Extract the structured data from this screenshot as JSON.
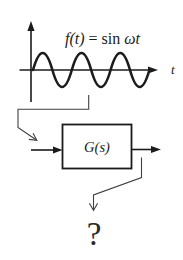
{
  "colors": {
    "ink": "#1b1b1b",
    "connector": "#404040",
    "background": "#ffffff"
  },
  "signal_plot": {
    "formula": {
      "lhs": "f(t)",
      "equals": " = ",
      "func": "sin",
      "arg": " ωt"
    },
    "time_axis_label": "t"
  },
  "system_block": {
    "label": "G(s)"
  },
  "output_question": {
    "label": "?"
  }
}
